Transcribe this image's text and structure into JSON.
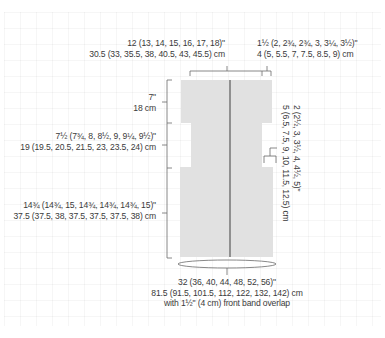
{
  "diagram": {
    "type": "knitting-schematic",
    "piece": "cardigan body (back and fronts worked in one piece)",
    "colors": {
      "fill": "#e1e1e1",
      "line": "#5a5a5a",
      "text": "#3a3a3a"
    },
    "labels": {
      "upper_width": {
        "imperial": "12 (13, 14, 15, 16, 17, 18)\"",
        "metric": "30.5 (33, 35.5, 38, 40.5, 43, 45.5) cm"
      },
      "front_band": {
        "imperial": "1½ (2, 2¾, 2¾, 3, 3¼, 3½)\"",
        "metric": "4 (5, 5.5, 7, 7.5, 8.5, 9) cm"
      },
      "yoke_height": {
        "imperial": "7\"",
        "metric": "18 cm"
      },
      "armhole_depth": {
        "imperial": "7½ (7¾, 8, 8½, 9, 9¼, 9½)\"",
        "metric": "19 (19.5, 20.5, 21.5, 23, 23.5, 24) cm"
      },
      "body_length": {
        "imperial": "14¾ (14¾, 15, 14¾, 14¾, 14¾, 15)\"",
        "metric": "37.5 (37.5, 38, 37.5, 37.5, 37.5, 38) cm"
      },
      "underarm_bindoff": {
        "imperial": "2 (2½, 3, 3½, 4, 4½, 5)\"",
        "metric": "5 (6.5, 7.5, 9, 10, 11.5, 12.5) cm"
      },
      "circumference": {
        "imperial": "32 (36, 40, 44, 48, 52, 56)\"",
        "metric": "81.5 (91.5, 101.5, 112, 122, 132, 142) cm",
        "note": "with 1½\" (4 cm) front band overlap"
      }
    }
  }
}
